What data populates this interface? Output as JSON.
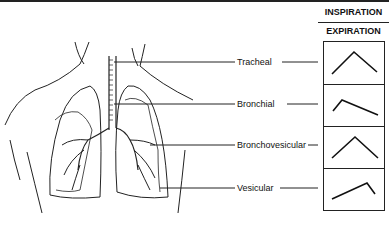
{
  "header": {
    "top_label": "INSPIRATION",
    "bottom_label": "EXPIRATION"
  },
  "breath_sounds": [
    {
      "name": "Tracheal",
      "pattern": "inspiration and expiration equal, steep"
    },
    {
      "name": "Bronchial",
      "pattern": "short inspiration, long expiration"
    },
    {
      "name": "Bronchovesicular",
      "pattern": "inspiration and expiration equal"
    },
    {
      "name": "Vesicular",
      "pattern": "long inspiration, short expiration"
    }
  ],
  "colors": {
    "line": "#222222",
    "background": "#ffffff"
  }
}
